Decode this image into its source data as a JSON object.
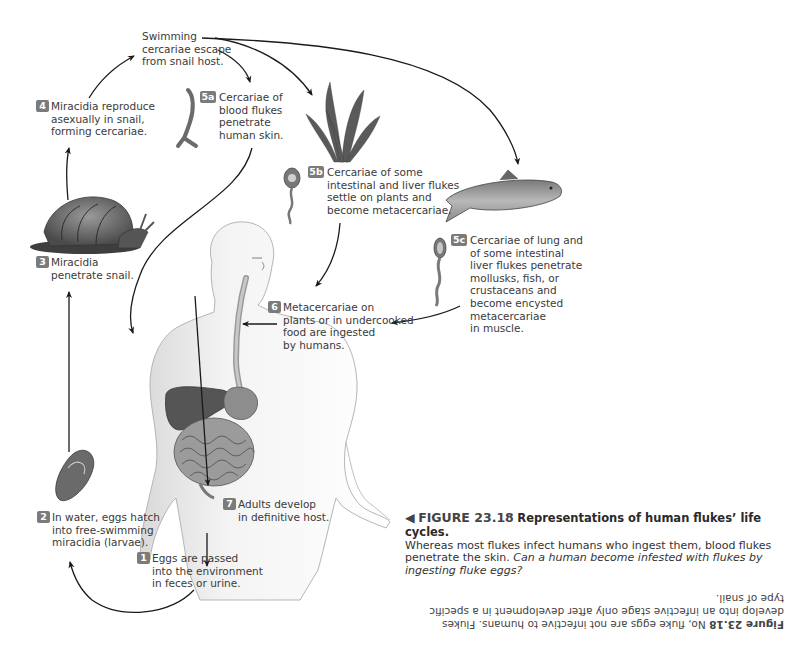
{
  "figure": {
    "number": "FIGURE 23.18",
    "title": "Representations of human flukes’ life cycles.",
    "caption_text": "Whereas most flukes infect humans who ingest them, blood flukes penetrate the skin.",
    "caption_question": "Can a human become infested with flukes by ingesting fluke eggs?",
    "pointer_glyph": "◀",
    "accent_color": "#7b7b7b"
  },
  "answer": {
    "label": "Figure 23.18",
    "text": "No, fluke eggs are not infective to humans. Flukes develop into an infective stage only after development in a specific type of snail.",
    "orientation": "upside-down"
  },
  "steps": {
    "s1": {
      "badge": "1",
      "lines": [
        "Eggs are passed",
        "into the environment",
        "in feces or urine."
      ]
    },
    "s2": {
      "badge": "2",
      "lines": [
        "In water, eggs hatch",
        "into free-swimming",
        "miracidia (larvae)."
      ]
    },
    "s3": {
      "badge": "3",
      "lines": [
        "Miracidia",
        "penetrate snail."
      ]
    },
    "s4": {
      "badge": "4",
      "lines": [
        "Miracidia reproduce",
        "asexually in snail,",
        "forming cercariae."
      ]
    },
    "swim": {
      "lines": [
        "Swimming",
        "cercariae escape",
        "from snail host."
      ]
    },
    "s5a": {
      "badge": "5a",
      "lines": [
        "Cercariae of",
        "blood flukes",
        "penetrate",
        "human skin."
      ]
    },
    "s5b": {
      "badge": "5b",
      "lines": [
        "Cercariae of some",
        "intestinal and liver flukes",
        "settle on plants and",
        "become metacercariae."
      ]
    },
    "s5c": {
      "badge": "5c",
      "lines": [
        "Cercariae of lung and",
        "of some intestinal",
        "liver flukes penetrate",
        "mollusks, fish, or",
        "crustaceans and",
        "become encysted",
        "metacercariae",
        "in muscle."
      ]
    },
    "s6": {
      "badge": "6",
      "lines": [
        "Metacercariae on",
        "plants or in undercooked",
        "food are ingested",
        "by humans."
      ]
    },
    "s7": {
      "badge": "7",
      "lines": [
        "Adults develop",
        "in definitive host."
      ]
    }
  },
  "illustrations": {
    "snail": "snail-illustration",
    "egg": "fluke-egg-illustration",
    "cercaria_5a": "forked-tail-cercaria",
    "cercaria_5b": "cercaria-on-plant",
    "cercaria_5c": "cercaria-lung-fluke",
    "plant": "aquatic-plant",
    "fish": "trout-fish",
    "human": "human-torso-with-digestive-tract"
  }
}
